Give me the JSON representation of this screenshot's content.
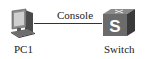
{
  "diagram": {
    "nodes": [
      {
        "id": "pc1",
        "label": "PC1",
        "icon": "pc-icon"
      },
      {
        "id": "switch",
        "label": "Switch",
        "icon": "switch-icon",
        "glyph": "S"
      }
    ],
    "links": [
      {
        "from": "pc1",
        "to": "switch",
        "label": "Console"
      }
    ]
  },
  "colors": {
    "line": "#333333",
    "switch_front": "#6b6b6b",
    "switch_top": "#8a8a8a",
    "switch_side": "#3a3a3a",
    "pc_body": "#7a7a7a"
  }
}
